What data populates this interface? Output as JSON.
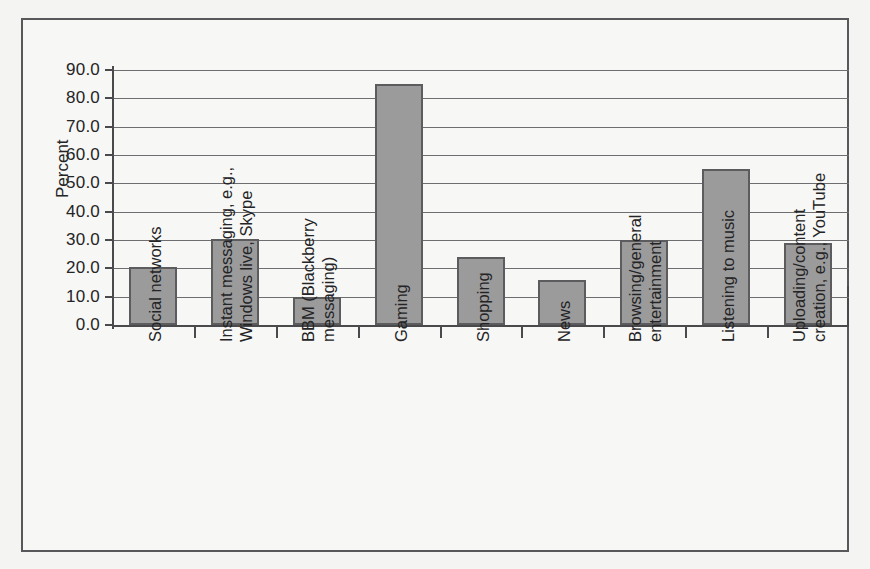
{
  "chart_data": {
    "type": "bar",
    "title": "",
    "xlabel": "",
    "ylabel": "Percent",
    "ylim": [
      0,
      90
    ],
    "ytick_step": 10,
    "grid": true,
    "legend": "none",
    "orientation": "vertical",
    "categories": [
      "Social networks",
      "Instant messaging, e.g.,\nWindows live, Skype",
      "BBM (Blackberry\nmessaging)",
      "Gaming",
      "Shopping",
      "News",
      "Browsing/general\nentertainment",
      "Listening to music",
      "Uploading/content\ncreation, e.g., YouTube"
    ],
    "values": [
      20.5,
      30.5,
      10.0,
      85.0,
      24.0,
      16.0,
      30.0,
      55.0,
      28.8
    ],
    "ytick_labels": [
      "90.0",
      "80.0",
      "70.0",
      "60.0",
      "50.0",
      "40.0",
      "30.0",
      "20.0",
      "10.0",
      "0.0"
    ],
    "ytick_values": [
      90,
      80,
      70,
      60,
      50,
      40,
      30,
      20,
      10,
      0
    ],
    "colors": {
      "bar_fill": "#9b9b9b",
      "bar_border": "#5c5c5e",
      "gridline": "#6e6e70",
      "axis": "#4a4a4c",
      "plot_background": "#f7f7f5",
      "figure_background": "#f4f4f2",
      "frame_border": "#58585a",
      "text": "#242426"
    }
  }
}
